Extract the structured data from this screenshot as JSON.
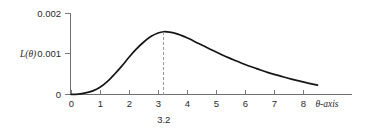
{
  "chart_data": {
    "type": "line",
    "title": "",
    "subtitle": "",
    "xlabel": "θ-axis",
    "ylabel": "L(θ)",
    "xlim": [
      0,
      8.9
    ],
    "ylim": [
      0,
      0.002
    ],
    "grid": false,
    "legend": null,
    "x_ticks": [
      "0",
      "1",
      "2",
      "3",
      "4",
      "5",
      "6",
      "7",
      "8"
    ],
    "x_tick_values": [
      0,
      1,
      2,
      3,
      4,
      5,
      6,
      7,
      8
    ],
    "y_ticks": [
      "0",
      "0.001",
      "0.002"
    ],
    "y_tick_values": [
      0,
      0.001,
      0.002
    ],
    "series": [
      {
        "name": "L(θ)",
        "color": "#161616",
        "x": [
          0.0,
          0.25,
          0.5,
          0.75,
          1.0,
          1.25,
          1.5,
          1.75,
          2.0,
          2.25,
          2.5,
          2.75,
          3.0,
          3.2,
          3.4,
          3.6,
          3.8,
          4.0,
          4.4,
          4.8,
          5.2,
          5.6,
          6.0,
          6.4,
          6.8,
          7.2,
          7.6,
          8.0,
          8.5
        ],
        "y": [
          0.0,
          1e-05,
          4e-05,
          9e-05,
          0.00018,
          0.00032,
          0.0005,
          0.0007,
          0.00092,
          0.00112,
          0.00129,
          0.00143,
          0.00152,
          0.00155,
          0.00154,
          0.00151,
          0.00146,
          0.0014,
          0.00126,
          0.00112,
          0.00098,
          0.00086,
          0.00074,
          0.00064,
          0.00054,
          0.00046,
          0.00038,
          0.00031,
          0.00023
        ]
      }
    ],
    "annotations": [
      {
        "type": "vertical-dashed-line",
        "label": "3.2",
        "x_value": 3.2,
        "y_from": 0,
        "y_to": 0.00155,
        "color": "#9a9a9a"
      }
    ]
  },
  "axes": {
    "y_axis_label": "L(θ)",
    "x_axis_label": "θ-axis",
    "y_tick_top": "0.002",
    "y_tick_mid": "0.001",
    "y_tick_zero": "0",
    "x_tick_0": "0",
    "x_tick_1": "1",
    "x_tick_2": "2",
    "x_tick_3": "3",
    "x_tick_4": "4",
    "x_tick_5": "5",
    "x_tick_6": "6",
    "x_tick_7": "7",
    "x_tick_8": "8"
  },
  "annotation": {
    "peak_label": "3.2"
  },
  "colors": {
    "curve": "#161616",
    "axis": "#6f6f6f",
    "marker": "#9a9a9a",
    "text": "#2a2a2a",
    "background": "#ffffff"
  }
}
